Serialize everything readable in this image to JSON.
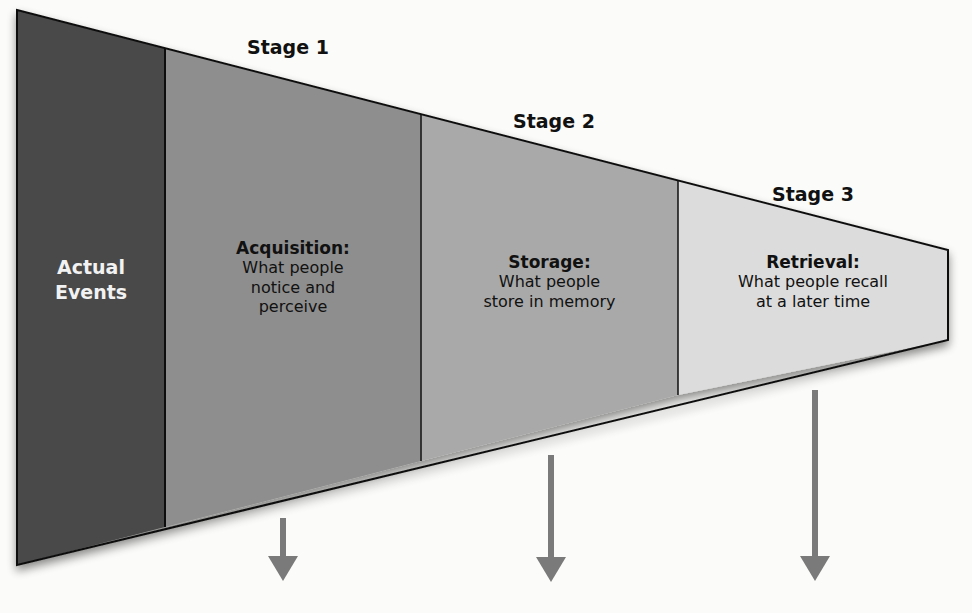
{
  "colors": {
    "actual_events": "#4a4a4a",
    "acquisition": "#8e8e8e",
    "storage": "#a9a9a9",
    "retrieval": "#dcdcdc",
    "outline": "#111111",
    "arrow": "#7a7a7a"
  },
  "segments": [
    {
      "id": "actual-events",
      "title_line1": "Actual",
      "title_line2": "Events"
    },
    {
      "id": "acquisition",
      "stage": "Stage 1",
      "title": "Acquisition:",
      "desc_line1": "What people",
      "desc_line2": "notice and",
      "desc_line3": "perceive"
    },
    {
      "id": "storage",
      "stage": "Stage 2",
      "title": "Storage:",
      "desc_line1": "What people",
      "desc_line2": "store in memory"
    },
    {
      "id": "retrieval",
      "stage": "Stage 3",
      "title": "Retrieval:",
      "desc_line1": "What people recall",
      "desc_line2": "at a later time"
    }
  ],
  "arrows": [
    {
      "target": "acquisition-loss"
    },
    {
      "target": "storage-loss"
    },
    {
      "target": "retrieval-loss"
    }
  ]
}
